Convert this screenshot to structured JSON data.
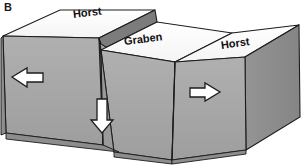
{
  "figure": {
    "panel_letter": "B",
    "labels": {
      "horst_left": "Horst",
      "graben": "Graben",
      "horst_right": "Horst"
    },
    "arrows": {
      "left": "arrow-left",
      "down": "arrow-down",
      "right": "arrow-right"
    },
    "colors": {
      "background": "#ffffff",
      "top_surface": "#fdfdfd",
      "front_face": "#a8a8a8",
      "side_face_dark": "#8f8f8f",
      "stratum_band": "#7a7a7a",
      "fault_face": "#9c9c9c",
      "outline": "#1c1c1c",
      "arrow_fill": "#ffffff",
      "arrow_outline": "#1c1c1c",
      "text": "#111111"
    }
  }
}
